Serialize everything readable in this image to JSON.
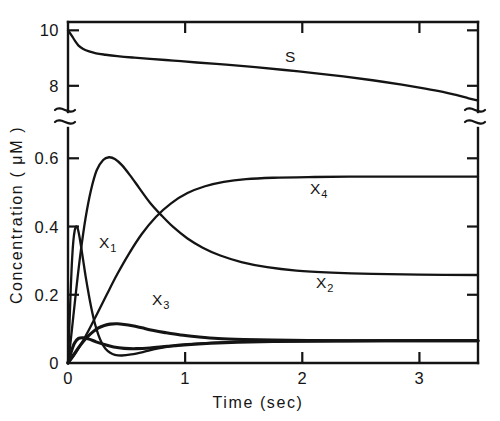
{
  "figure": {
    "name": "concentration-vs-time-plot",
    "background": "#ffffff",
    "ink_color": "#141414"
  },
  "axes": {
    "x": {
      "title": "Time (sec)",
      "tick_labels": [
        "0",
        "1",
        "2",
        "3"
      ],
      "tick_values": [
        0,
        1,
        2,
        3
      ],
      "range": [
        0,
        3.5
      ]
    },
    "y": {
      "title": "Concentration ( μM )",
      "broken": true,
      "lower_tick_labels": [
        "0",
        "0.2",
        "0.4",
        "0.6"
      ],
      "lower_tick_values": [
        0,
        0.2,
        0.4,
        0.6
      ],
      "upper_tick_labels": [
        "8",
        "10"
      ],
      "upper_tick_values": [
        8,
        10
      ],
      "lower_range": [
        0,
        0.68
      ],
      "upper_range": [
        7.2,
        10.3
      ]
    }
  },
  "curve_labels": [
    {
      "id": "S",
      "base": "S",
      "sub": "",
      "x": 285,
      "y": 62
    },
    {
      "id": "X1",
      "base": "X",
      "sub": "1",
      "x": 99,
      "y": 248
    },
    {
      "id": "X2",
      "base": "X",
      "sub": "2",
      "x": 316,
      "y": 288
    },
    {
      "id": "X3",
      "base": "X",
      "sub": "3",
      "x": 152,
      "y": 305
    },
    {
      "id": "X4",
      "base": "X",
      "sub": "4",
      "x": 310,
      "y": 194
    }
  ],
  "chart_data": {
    "type": "line",
    "title": "",
    "xlabel": "Time (sec)",
    "ylabel": "Concentration ( μM )",
    "xlim": [
      0,
      3.5
    ],
    "ylim_lower": [
      0,
      0.68
    ],
    "ylim_upper": [
      7.2,
      10.3
    ],
    "broken_y_axis": true,
    "grid": false,
    "legend": "inline-curve-labels",
    "series": [
      {
        "name": "S",
        "panel": "upper",
        "points": [
          [
            0.0,
            10.0
          ],
          [
            0.03,
            9.82
          ],
          [
            0.06,
            9.62
          ],
          [
            0.09,
            9.45
          ],
          [
            0.13,
            9.33
          ],
          [
            0.18,
            9.24
          ],
          [
            0.24,
            9.17
          ],
          [
            0.32,
            9.12
          ],
          [
            0.42,
            9.07
          ],
          [
            0.55,
            9.02
          ],
          [
            0.7,
            8.97
          ],
          [
            0.9,
            8.91
          ],
          [
            1.1,
            8.84
          ],
          [
            1.35,
            8.76
          ],
          [
            1.6,
            8.67
          ],
          [
            1.85,
            8.57
          ],
          [
            2.1,
            8.46
          ],
          [
            2.35,
            8.34
          ],
          [
            2.6,
            8.2
          ],
          [
            2.85,
            8.04
          ],
          [
            3.05,
            7.9
          ],
          [
            3.2,
            7.78
          ],
          [
            3.32,
            7.66
          ],
          [
            3.42,
            7.55
          ],
          [
            3.5,
            7.47
          ]
        ]
      },
      {
        "name": "X1",
        "panel": "lower",
        "points": [
          [
            0.0,
            0.0
          ],
          [
            0.01,
            0.09
          ],
          [
            0.02,
            0.185
          ],
          [
            0.032,
            0.285
          ],
          [
            0.045,
            0.355
          ],
          [
            0.058,
            0.39
          ],
          [
            0.07,
            0.4
          ],
          [
            0.082,
            0.395
          ],
          [
            0.095,
            0.375
          ],
          [
            0.11,
            0.345
          ],
          [
            0.13,
            0.3
          ],
          [
            0.15,
            0.255
          ],
          [
            0.175,
            0.205
          ],
          [
            0.2,
            0.16
          ],
          [
            0.23,
            0.115
          ],
          [
            0.26,
            0.082
          ],
          [
            0.29,
            0.058
          ],
          [
            0.32,
            0.042
          ],
          [
            0.36,
            0.03
          ],
          [
            0.4,
            0.024
          ],
          [
            0.46,
            0.022
          ],
          [
            0.54,
            0.025
          ],
          [
            0.64,
            0.032
          ],
          [
            0.76,
            0.042
          ],
          [
            0.9,
            0.05
          ],
          [
            1.1,
            0.057
          ],
          [
            1.4,
            0.062
          ],
          [
            1.8,
            0.064
          ],
          [
            2.3,
            0.065
          ],
          [
            3.0,
            0.066
          ],
          [
            3.5,
            0.066
          ]
        ]
      },
      {
        "name": "X2",
        "panel": "lower",
        "points": [
          [
            0.0,
            0.0
          ],
          [
            0.02,
            0.055
          ],
          [
            0.045,
            0.135
          ],
          [
            0.075,
            0.23
          ],
          [
            0.11,
            0.33
          ],
          [
            0.15,
            0.425
          ],
          [
            0.195,
            0.505
          ],
          [
            0.245,
            0.565
          ],
          [
            0.3,
            0.595
          ],
          [
            0.35,
            0.603
          ],
          [
            0.4,
            0.598
          ],
          [
            0.46,
            0.58
          ],
          [
            0.53,
            0.55
          ],
          [
            0.61,
            0.512
          ],
          [
            0.7,
            0.47
          ],
          [
            0.8,
            0.432
          ],
          [
            0.9,
            0.398
          ],
          [
            1.02,
            0.365
          ],
          [
            1.15,
            0.338
          ],
          [
            1.3,
            0.315
          ],
          [
            1.48,
            0.296
          ],
          [
            1.7,
            0.281
          ],
          [
            1.95,
            0.271
          ],
          [
            2.25,
            0.265
          ],
          [
            2.6,
            0.261
          ],
          [
            3.0,
            0.259
          ],
          [
            3.5,
            0.258
          ]
        ]
      },
      {
        "name": "X3",
        "panel": "lower",
        "points": [
          [
            0.0,
            0.0
          ],
          [
            0.02,
            0.01
          ],
          [
            0.05,
            0.025
          ],
          [
            0.09,
            0.045
          ],
          [
            0.13,
            0.063
          ],
          [
            0.17,
            0.078
          ],
          [
            0.215,
            0.092
          ],
          [
            0.26,
            0.103
          ],
          [
            0.31,
            0.11
          ],
          [
            0.36,
            0.114
          ],
          [
            0.42,
            0.115
          ],
          [
            0.48,
            0.113
          ],
          [
            0.55,
            0.109
          ],
          [
            0.63,
            0.103
          ],
          [
            0.72,
            0.096
          ],
          [
            0.83,
            0.089
          ],
          [
            0.96,
            0.082
          ],
          [
            1.1,
            0.077
          ],
          [
            1.28,
            0.072
          ],
          [
            1.5,
            0.069
          ],
          [
            1.75,
            0.067
          ],
          [
            2.05,
            0.066
          ],
          [
            2.4,
            0.065
          ],
          [
            2.9,
            0.065
          ],
          [
            3.5,
            0.065
          ]
        ]
      },
      {
        "name": "X4",
        "panel": "lower",
        "points": [
          [
            0.0,
            0.0
          ],
          [
            0.03,
            0.012
          ],
          [
            0.07,
            0.032
          ],
          [
            0.12,
            0.06
          ],
          [
            0.18,
            0.098
          ],
          [
            0.25,
            0.145
          ],
          [
            0.33,
            0.2
          ],
          [
            0.42,
            0.26
          ],
          [
            0.52,
            0.32
          ],
          [
            0.63,
            0.378
          ],
          [
            0.75,
            0.428
          ],
          [
            0.88,
            0.468
          ],
          [
            1.02,
            0.498
          ],
          [
            1.17,
            0.518
          ],
          [
            1.33,
            0.531
          ],
          [
            1.52,
            0.539
          ],
          [
            1.75,
            0.543
          ],
          [
            2.05,
            0.545
          ],
          [
            2.4,
            0.546
          ],
          [
            2.9,
            0.546
          ],
          [
            3.5,
            0.546
          ]
        ]
      },
      {
        "name": "X5-lower-transient",
        "panel": "lower",
        "points": [
          [
            0.0,
            0.0
          ],
          [
            0.025,
            0.03
          ],
          [
            0.055,
            0.058
          ],
          [
            0.09,
            0.072
          ],
          [
            0.13,
            0.074
          ],
          [
            0.18,
            0.07
          ],
          [
            0.24,
            0.062
          ],
          [
            0.31,
            0.054
          ],
          [
            0.39,
            0.047
          ],
          [
            0.48,
            0.043
          ],
          [
            0.58,
            0.042
          ],
          [
            0.7,
            0.044
          ],
          [
            0.85,
            0.049
          ],
          [
            1.02,
            0.054
          ],
          [
            1.22,
            0.058
          ],
          [
            1.45,
            0.061
          ],
          [
            1.75,
            0.063
          ],
          [
            2.15,
            0.064
          ],
          [
            2.7,
            0.065
          ],
          [
            3.5,
            0.065
          ]
        ]
      }
    ]
  }
}
